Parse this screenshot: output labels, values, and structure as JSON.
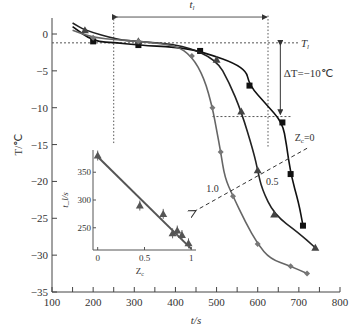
{
  "chart_data": [
    {
      "type": "line",
      "title": "",
      "xlabel": "t/s",
      "ylabel": "T/℃",
      "xlim": [
        100,
        800
      ],
      "ylim": [
        -35,
        2
      ],
      "xticks": [
        100,
        200,
        300,
        400,
        500,
        600,
        700,
        800
      ],
      "yticks": [
        0,
        -5,
        -10,
        -15,
        -20,
        -25,
        -30,
        -35
      ],
      "grid": false,
      "series": [
        {
          "name": "Z_c=0",
          "marker": "square",
          "color": "#111111",
          "x": [
            150,
            200,
            260,
            310,
            400,
            460,
            570,
            580,
            620,
            660,
            670,
            680,
            700,
            710
          ],
          "y": [
            1,
            -1.0,
            -1.2,
            -1.5,
            -1.8,
            -2.3,
            -4.5,
            -7.0,
            -9.5,
            -12.0,
            -15.0,
            -19.0,
            -23.0,
            -26.0
          ]
        },
        {
          "name": "Z_c=0.5",
          "marker": "triangle",
          "color": "#222222",
          "x": [
            150,
            180,
            260,
            310,
            420,
            500,
            530,
            560,
            590,
            600,
            610,
            640,
            700,
            740
          ],
          "y": [
            1.5,
            0.5,
            -0.8,
            -1.0,
            -1.5,
            -3.5,
            -6.5,
            -10.5,
            -16.0,
            -18.5,
            -21.0,
            -24.5,
            -27.0,
            -29.0
          ]
        },
        {
          "name": "Z_c=1.0",
          "marker": "diamond",
          "color": "#666666",
          "x": [
            150,
            200,
            260,
            310,
            400,
            440,
            470,
            490,
            500,
            510,
            520,
            540,
            570,
            600,
            630,
            680,
            720
          ],
          "y": [
            0.5,
            -0.5,
            -0.8,
            -1.0,
            -1.5,
            -3.0,
            -6.0,
            -10.0,
            -13.0,
            -16.0,
            -19.5,
            -22.0,
            -25.5,
            -28.5,
            -30.5,
            -31.5,
            -32.5
          ]
        }
      ],
      "annotations": [
        {
          "text": "t_l",
          "type": "double-arrow",
          "from_x": 250,
          "to_x": 625,
          "y": 2.3
        },
        {
          "text": "T_l",
          "type": "hline-dotted",
          "y": -1.2
        },
        {
          "text": "ΔT=−10℃",
          "type": "double-arrow-vertical",
          "x": 655,
          "from_y": -1.2,
          "to_y": -11.2
        },
        {
          "type": "hline-dotted",
          "y": -11.2,
          "from_x": 490,
          "to_x": 680
        },
        {
          "type": "vline-dotted",
          "x": 250,
          "from_y": 2.5,
          "to_y": -14.8
        },
        {
          "type": "vline-dotted",
          "x": 625,
          "from_y": 2.5,
          "to_y": -15.5
        },
        {
          "text": "Z_c=0",
          "x": 690,
          "y": -14.5
        },
        {
          "text": "0.5",
          "x": 620,
          "y": -20.5
        },
        {
          "text": "1.0",
          "x": 475,
          "y": -21.5
        },
        {
          "type": "dashed-arrow",
          "from_x": 700,
          "from_y": -16.5,
          "to_x": 445,
          "to_y": -24.0
        }
      ]
    },
    {
      "type": "scatter",
      "title": "inset",
      "xlabel": "Z_c",
      "ylabel": "t_l/s",
      "xticks": [
        0,
        0.5,
        1
      ],
      "yticks": [
        250,
        300,
        350
      ],
      "xlim": [
        -0.05,
        1.05
      ],
      "ylim": [
        210,
        390
      ],
      "series": [
        {
          "name": "data",
          "marker": "triangle",
          "x": [
            0,
            0.45,
            0.7,
            0.8,
            0.85,
            0.9,
            0.97
          ],
          "y": [
            380,
            290,
            275,
            240,
            245,
            237,
            222
          ]
        },
        {
          "name": "linear fit",
          "type": "line",
          "x": [
            0,
            1.0
          ],
          "y": [
            378,
            212
          ]
        }
      ]
    }
  ]
}
